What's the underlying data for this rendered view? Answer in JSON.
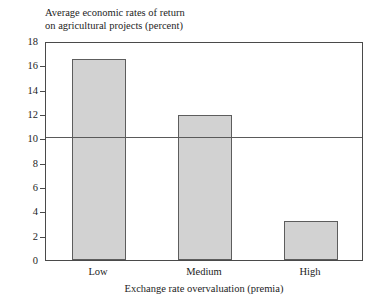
{
  "chart_data": {
    "type": "bar",
    "title": "Average economic rates of return\non agricultural projects (percent)",
    "title_line1": "Average economic rates of return",
    "title_line2": "on agricultural projects (percent)",
    "xlabel": "Exchange rate overvaluation (premia)",
    "ylabel": "",
    "categories": [
      "Low",
      "Medium",
      "High"
    ],
    "values": [
      16.5,
      11.9,
      3.2
    ],
    "ylim": [
      0,
      18
    ],
    "ytick_step": 2,
    "yticks": [
      0,
      2,
      4,
      6,
      8,
      10,
      12,
      14,
      16,
      18
    ],
    "ytick_labels": [
      "0",
      "2",
      "4",
      "6",
      "8",
      "10",
      "12",
      "14",
      "16",
      "18"
    ],
    "grid": false,
    "legend": "none",
    "reference_line": 10,
    "bar_fill_color": "#d2d2d2",
    "bar_edge_color": "#5d5d5d",
    "axis_color": "#4a4a4a",
    "background_color": "#ffffff"
  }
}
